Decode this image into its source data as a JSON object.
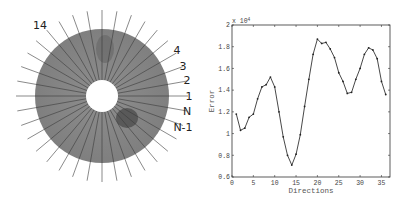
{
  "disk_figure": {
    "center": [
      102,
      96
    ],
    "outer_radius": 67,
    "inner_radius": 16,
    "line_length": 86,
    "num_lines": 36,
    "fill_color": "#8a8a8a",
    "labels": [
      {
        "text": "14",
        "angle_deg": 130,
        "x": 40,
        "y": 29
      },
      {
        "text": "4",
        "angle_deg": 30,
        "x": 177,
        "y": 54
      },
      {
        "text": "3",
        "angle_deg": 20,
        "x": 183,
        "y": 70
      },
      {
        "text": "2",
        "angle_deg": 10,
        "x": 187,
        "y": 84
      },
      {
        "text": "1",
        "angle_deg": 0,
        "x": 189,
        "y": 100
      },
      {
        "text": "N",
        "angle_deg": -10,
        "x": 187,
        "y": 115
      },
      {
        "text": "N-1",
        "angle_deg": -20,
        "x": 183,
        "y": 131
      }
    ]
  },
  "chart_data": {
    "type": "line",
    "title": "",
    "xlabel": "Directions",
    "ylabel": "Error",
    "y_multiplier": "x 10^4",
    "xlim": [
      0,
      37
    ],
    "ylim": [
      0.6,
      2.0
    ],
    "x_ticks": [
      0,
      5,
      10,
      15,
      20,
      25,
      30,
      35
    ],
    "y_ticks": [
      0.6,
      0.8,
      1,
      1.2,
      1.4,
      1.6,
      1.8,
      2
    ],
    "y_tick_labels": [
      "0.6",
      "0.8",
      "1",
      "1.2",
      "1.4",
      "1.6",
      "1.8",
      "2"
    ],
    "grid": false,
    "series": [
      {
        "name": "Error",
        "marker": "dot",
        "x": [
          1,
          2,
          3,
          4,
          5,
          6,
          7,
          8,
          9,
          10,
          11,
          12,
          13,
          14,
          15,
          16,
          17,
          18,
          19,
          20,
          21,
          22,
          23,
          24,
          25,
          26,
          27,
          28,
          29,
          30,
          31,
          32,
          33,
          34,
          35,
          36
        ],
        "values": [
          1.18,
          1.03,
          1.05,
          1.15,
          1.18,
          1.32,
          1.43,
          1.45,
          1.52,
          1.43,
          1.2,
          0.97,
          0.8,
          0.71,
          0.81,
          0.99,
          1.25,
          1.5,
          1.73,
          1.87,
          1.83,
          1.84,
          1.78,
          1.7,
          1.56,
          1.48,
          1.37,
          1.38,
          1.5,
          1.6,
          1.73,
          1.79,
          1.77,
          1.69,
          1.48,
          1.36
        ]
      }
    ]
  },
  "plot_box": {
    "left": 232,
    "right": 390,
    "top": 25,
    "bottom": 177
  }
}
